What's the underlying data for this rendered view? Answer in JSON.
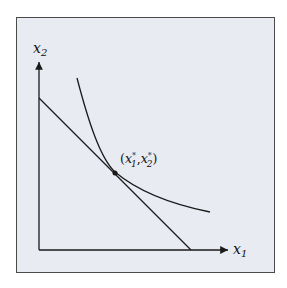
{
  "diagram": {
    "type": "consumer-optimum",
    "y_axis_label": {
      "base": "x",
      "sub": "2"
    },
    "x_axis_label": {
      "base": "x",
      "sub": "1"
    },
    "point_label": {
      "open": "(",
      "a_base": "x",
      "a_sub": "1",
      "star": "*",
      "sep": ",",
      "b_base": "x",
      "b_sub": "2",
      "close": ")"
    },
    "elements": [
      "indifference-curve",
      "budget-line",
      "optimum-point"
    ],
    "colors": {
      "background": "#e9ebf3",
      "stroke": "#1a1a1a",
      "frame": "#4a4a4a"
    }
  }
}
